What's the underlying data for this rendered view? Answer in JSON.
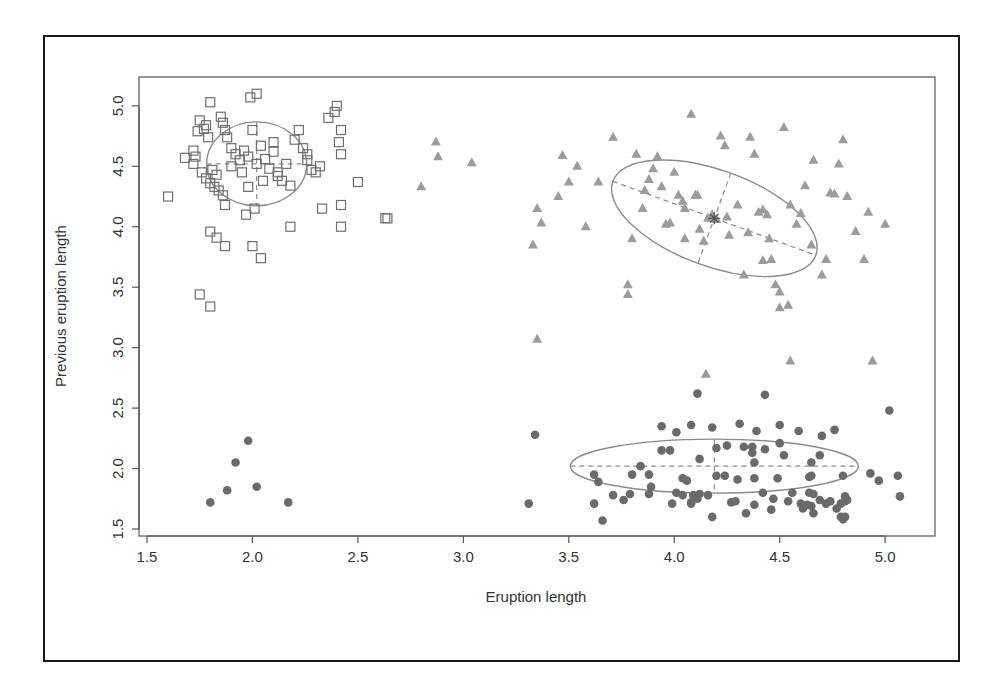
{
  "chart_data": {
    "type": "scatter",
    "title": "",
    "xlabel": "Eruption length",
    "ylabel": "Previous eruption length",
    "xlim": [
      1.45,
      5.2
    ],
    "ylim": [
      1.45,
      5.2
    ],
    "xticks": [
      "1.5",
      "2.0",
      "2.5",
      "3.0",
      "3.5",
      "4.0",
      "4.5",
      "5.0"
    ],
    "yticks": [
      "1.5",
      "2.0",
      "2.5",
      "3.0",
      "3.5",
      "4.0",
      "4.5",
      "5.0"
    ],
    "grid": false,
    "legend": null,
    "colors": {
      "squares": "#6f6f6f",
      "triangles": "#9c9c9c",
      "circles": "#6a6a6a",
      "ellipse": "#8a8a8a",
      "frame": "#1a1a1a",
      "axis": "#555555"
    },
    "series": [
      {
        "name": "cluster-1-squares",
        "marker": "open-square",
        "points": [
          [
            1.6,
            4.25
          ],
          [
            1.68,
            4.57
          ],
          [
            1.72,
            4.63
          ],
          [
            1.75,
            4.88
          ],
          [
            1.77,
            4.81
          ],
          [
            1.79,
            4.74
          ],
          [
            1.8,
            5.03
          ],
          [
            1.78,
            4.84
          ],
          [
            1.74,
            4.79
          ],
          [
            1.73,
            4.58
          ],
          [
            1.72,
            4.52
          ],
          [
            1.76,
            4.45
          ],
          [
            1.78,
            4.4
          ],
          [
            1.8,
            4.36
          ],
          [
            1.82,
            4.33
          ],
          [
            1.84,
            4.3
          ],
          [
            1.86,
            4.26
          ],
          [
            1.87,
            4.18
          ],
          [
            1.81,
            4.47
          ],
          [
            1.83,
            4.43
          ],
          [
            1.85,
            4.91
          ],
          [
            1.86,
            4.86
          ],
          [
            1.87,
            4.8
          ],
          [
            1.88,
            4.74
          ],
          [
            1.9,
            4.65
          ],
          [
            1.92,
            4.6
          ],
          [
            1.94,
            4.55
          ],
          [
            1.96,
            4.63
          ],
          [
            1.98,
            4.58
          ],
          [
            2.0,
            4.8
          ],
          [
            2.02,
            4.52
          ],
          [
            2.04,
            4.67
          ],
          [
            2.06,
            4.56
          ],
          [
            2.08,
            4.48
          ],
          [
            2.1,
            4.62
          ],
          [
            2.12,
            4.45
          ],
          [
            2.14,
            4.38
          ],
          [
            2.16,
            4.52
          ],
          [
            2.18,
            4.34
          ],
          [
            1.98,
            4.33
          ],
          [
            1.99,
            5.07
          ],
          [
            2.02,
            5.1
          ],
          [
            2.01,
            4.15
          ],
          [
            1.97,
            4.1
          ],
          [
            2.2,
            4.72
          ],
          [
            2.22,
            4.8
          ],
          [
            2.24,
            4.65
          ],
          [
            2.26,
            4.55
          ],
          [
            2.28,
            4.47
          ],
          [
            2.3,
            4.45
          ],
          [
            2.32,
            4.5
          ],
          [
            2.26,
            4.6
          ],
          [
            2.33,
            4.15
          ],
          [
            2.36,
            4.9
          ],
          [
            2.39,
            4.95
          ],
          [
            2.4,
            5.0
          ],
          [
            2.42,
            4.8
          ],
          [
            2.41,
            4.7
          ],
          [
            2.42,
            4.6
          ],
          [
            2.42,
            4.18
          ],
          [
            2.42,
            4.0
          ],
          [
            2.5,
            4.37
          ],
          [
            2.63,
            4.07
          ],
          [
            2.64,
            4.07
          ],
          [
            2.18,
            4.0
          ],
          [
            1.8,
            3.96
          ],
          [
            1.83,
            3.91
          ],
          [
            1.87,
            3.84
          ],
          [
            2.0,
            3.84
          ],
          [
            2.04,
            3.74
          ],
          [
            1.75,
            3.44
          ],
          [
            1.8,
            3.34
          ],
          [
            2.12,
            4.42
          ],
          [
            2.05,
            4.38
          ],
          [
            1.95,
            4.45
          ],
          [
            1.9,
            4.5
          ],
          [
            2.1,
            4.7
          ]
        ]
      },
      {
        "name": "cluster-2-triangles",
        "marker": "filled-triangle",
        "points": [
          [
            2.8,
            4.33
          ],
          [
            2.87,
            4.7
          ],
          [
            2.88,
            4.58
          ],
          [
            3.04,
            4.53
          ],
          [
            3.35,
            4.15
          ],
          [
            3.33,
            3.85
          ],
          [
            3.37,
            4.03
          ],
          [
            3.45,
            4.25
          ],
          [
            3.47,
            4.59
          ],
          [
            3.5,
            4.37
          ],
          [
            3.54,
            4.5
          ],
          [
            3.58,
            4.0
          ],
          [
            3.64,
            4.37
          ],
          [
            3.71,
            4.74
          ],
          [
            3.35,
            3.07
          ],
          [
            3.78,
            3.52
          ],
          [
            3.78,
            3.44
          ],
          [
            3.82,
            4.6
          ],
          [
            3.86,
            4.3
          ],
          [
            3.88,
            4.39
          ],
          [
            3.9,
            4.48
          ],
          [
            3.92,
            4.58
          ],
          [
            3.94,
            4.33
          ],
          [
            3.96,
            4.02
          ],
          [
            3.98,
            4.03
          ],
          [
            4.0,
            4.45
          ],
          [
            4.02,
            4.26
          ],
          [
            4.04,
            4.21
          ],
          [
            4.05,
            4.15
          ],
          [
            4.08,
            4.93
          ],
          [
            4.1,
            4.26
          ],
          [
            4.11,
            4.26
          ],
          [
            4.12,
            3.98
          ],
          [
            4.14,
            3.88
          ],
          [
            4.16,
            4.07
          ],
          [
            4.18,
            4.1
          ],
          [
            4.2,
            4.06
          ],
          [
            4.22,
            4.75
          ],
          [
            4.24,
            4.67
          ],
          [
            4.25,
            4.08
          ],
          [
            4.26,
            3.93
          ],
          [
            4.3,
            4.18
          ],
          [
            4.33,
            3.6
          ],
          [
            4.36,
            4.74
          ],
          [
            4.38,
            4.6
          ],
          [
            4.4,
            4.12
          ],
          [
            4.42,
            4.14
          ],
          [
            4.44,
            4.1
          ],
          [
            4.46,
            3.73
          ],
          [
            4.48,
            3.52
          ],
          [
            4.5,
            3.33
          ],
          [
            4.52,
            4.82
          ],
          [
            4.55,
            4.18
          ],
          [
            4.58,
            4.02
          ],
          [
            4.6,
            4.11
          ],
          [
            4.62,
            4.34
          ],
          [
            4.66,
            4.55
          ],
          [
            4.7,
            3.6
          ],
          [
            4.72,
            3.73
          ],
          [
            4.74,
            4.28
          ],
          [
            4.76,
            4.27
          ],
          [
            4.78,
            4.52
          ],
          [
            4.8,
            4.72
          ],
          [
            4.82,
            4.25
          ],
          [
            4.86,
            3.96
          ],
          [
            4.9,
            3.73
          ],
          [
            4.92,
            4.12
          ],
          [
            5.0,
            4.02
          ],
          [
            4.42,
            3.72
          ],
          [
            4.5,
            3.46
          ],
          [
            4.54,
            3.35
          ],
          [
            4.55,
            2.89
          ],
          [
            4.94,
            2.89
          ],
          [
            4.15,
            2.78
          ],
          [
            3.85,
            4.15
          ],
          [
            3.8,
            3.9
          ],
          [
            4.05,
            3.9
          ],
          [
            4.35,
            3.95
          ],
          [
            4.45,
            3.9
          ],
          [
            4.65,
            3.85
          ]
        ]
      },
      {
        "name": "cluster-3-circles",
        "marker": "filled-circle",
        "points": [
          [
            1.98,
            2.23
          ],
          [
            1.92,
            2.05
          ],
          [
            1.88,
            1.82
          ],
          [
            2.02,
            1.85
          ],
          [
            1.8,
            1.72
          ],
          [
            2.17,
            1.72
          ],
          [
            3.34,
            2.28
          ],
          [
            4.11,
            2.62
          ],
          [
            4.43,
            2.61
          ],
          [
            5.02,
            2.48
          ],
          [
            3.94,
            2.35
          ],
          [
            4.08,
            2.36
          ],
          [
            4.31,
            2.37
          ],
          [
            4.01,
            2.3
          ],
          [
            4.18,
            2.34
          ],
          [
            4.5,
            2.36
          ],
          [
            4.76,
            2.32
          ],
          [
            4.39,
            2.31
          ],
          [
            4.59,
            2.31
          ],
          [
            4.7,
            2.27
          ],
          [
            3.94,
            2.15
          ],
          [
            3.98,
            2.15
          ],
          [
            4.2,
            2.17
          ],
          [
            4.25,
            2.19
          ],
          [
            4.33,
            2.18
          ],
          [
            4.37,
            2.18
          ],
          [
            4.43,
            2.16
          ],
          [
            4.5,
            2.21
          ],
          [
            4.52,
            2.11
          ],
          [
            4.69,
            2.11
          ],
          [
            4.12,
            2.08
          ],
          [
            4.37,
            2.13
          ],
          [
            4.38,
            2.05
          ],
          [
            4.65,
            2.05
          ],
          [
            3.84,
            2.02
          ],
          [
            3.62,
            1.95
          ],
          [
            3.8,
            1.95
          ],
          [
            3.88,
            1.95
          ],
          [
            4.04,
            1.92
          ],
          [
            4.06,
            1.9
          ],
          [
            4.2,
            1.94
          ],
          [
            4.24,
            1.94
          ],
          [
            4.3,
            1.91
          ],
          [
            4.38,
            1.92
          ],
          [
            4.49,
            1.92
          ],
          [
            4.64,
            1.93
          ],
          [
            4.65,
            1.94
          ],
          [
            4.8,
            1.94
          ],
          [
            4.93,
            1.96
          ],
          [
            5.06,
            1.94
          ],
          [
            3.64,
            1.89
          ],
          [
            3.89,
            1.85
          ],
          [
            4.09,
            1.78
          ],
          [
            4.11,
            1.75
          ],
          [
            3.88,
            1.79
          ],
          [
            4.42,
            1.8
          ],
          [
            4.56,
            1.8
          ],
          [
            4.66,
            1.79
          ],
          [
            4.64,
            1.8
          ],
          [
            4.69,
            1.74
          ],
          [
            4.72,
            1.71
          ],
          [
            4.81,
            1.77
          ],
          [
            3.71,
            1.78
          ],
          [
            3.79,
            1.79
          ],
          [
            4.01,
            1.8
          ],
          [
            4.04,
            1.78
          ],
          [
            4.08,
            1.72
          ],
          [
            4.12,
            1.79
          ],
          [
            4.16,
            1.78
          ],
          [
            4.38,
            1.7
          ],
          [
            4.47,
            1.75
          ],
          [
            4.54,
            1.73
          ],
          [
            4.6,
            1.71
          ],
          [
            4.63,
            1.7
          ],
          [
            4.65,
            1.69
          ],
          [
            4.74,
            1.73
          ],
          [
            4.81,
            1.73
          ],
          [
            4.82,
            1.74
          ],
          [
            3.31,
            1.71
          ],
          [
            3.62,
            1.71
          ],
          [
            3.76,
            1.74
          ],
          [
            3.99,
            1.71
          ],
          [
            4.08,
            1.71
          ],
          [
            4.27,
            1.72
          ],
          [
            4.29,
            1.73
          ],
          [
            4.34,
            1.63
          ],
          [
            4.46,
            1.66
          ],
          [
            4.61,
            1.67
          ],
          [
            4.66,
            1.63
          ],
          [
            4.77,
            1.67
          ],
          [
            4.79,
            1.71
          ],
          [
            3.66,
            1.57
          ],
          [
            4.18,
            1.6
          ],
          [
            4.79,
            1.6
          ],
          [
            4.81,
            1.6
          ],
          [
            4.97,
            1.9
          ],
          [
            5.07,
            1.77
          ],
          [
            4.8,
            1.58
          ]
        ]
      }
    ],
    "ellipses": [
      {
        "name": "cluster-1-ellipse",
        "cx": 2.02,
        "cy": 4.52,
        "rx_px": 50,
        "ry_px": 42,
        "angle_deg": 0,
        "dashed_axes": true
      },
      {
        "name": "cluster-2-ellipse",
        "cx": 4.19,
        "cy": 4.07,
        "rx_px": 108,
        "ry_px": 48,
        "angle_deg": 20,
        "dashed_axes": true
      },
      {
        "name": "cluster-3-ellipse",
        "cx": 4.19,
        "cy": 2.02,
        "rx_px": 144,
        "ry_px": 27,
        "angle_deg": 0,
        "dashed_axes": true
      }
    ],
    "centroid_markers": [
      {
        "name": "cluster-2-centroid-star",
        "x": 4.19,
        "y": 4.07
      }
    ]
  }
}
